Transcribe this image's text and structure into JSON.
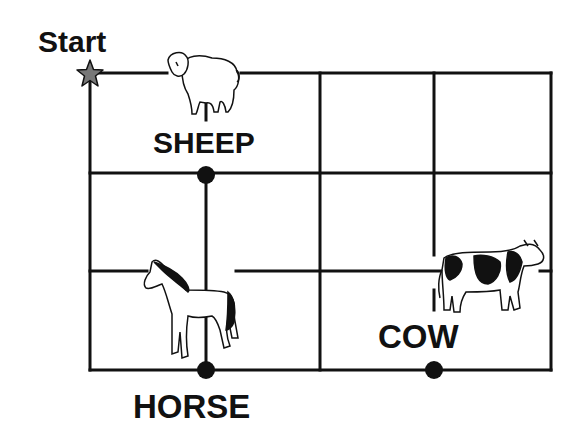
{
  "diagram": {
    "type": "grid-map",
    "grid": {
      "columns": 4,
      "rows": 3,
      "x_lines": [
        90,
        206,
        320,
        434,
        551
      ],
      "y_lines": [
        73,
        173,
        271,
        370
      ],
      "line_color": "#111111"
    },
    "start": {
      "label": "Start",
      "marker": "star-icon",
      "marker_color": "#666666",
      "position": [
        90,
        73
      ]
    },
    "locations": [
      {
        "id": "sheep",
        "label": "SHEEP",
        "icon": "sheep-icon",
        "dot": [
          206,
          175
        ]
      },
      {
        "id": "horse",
        "label": "HORSE",
        "icon": "horse-icon",
        "dot": [
          206,
          370
        ]
      },
      {
        "id": "cow",
        "label": "COW",
        "icon": "cow-icon",
        "dot": [
          434,
          370
        ]
      }
    ]
  }
}
